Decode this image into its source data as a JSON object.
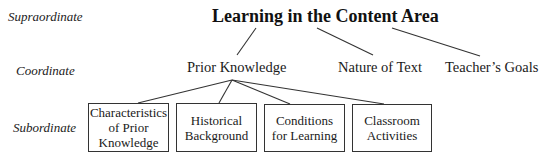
{
  "diagram": {
    "levels": {
      "supraordinate": "Supraordinate",
      "coordinate": "Coordinate",
      "subordinate": "Subordinate"
    },
    "root": {
      "label": "Learning in the Content Area"
    },
    "coordinates": [
      {
        "label": "Prior Knowledge"
      },
      {
        "label": "Nature of Text"
      },
      {
        "label": "Teacher’s Goals"
      }
    ],
    "subordinates": [
      {
        "line1": "Characteristics",
        "line2": "of Prior",
        "line3": "Knowledge"
      },
      {
        "line1": "Historical",
        "line2": "Background"
      },
      {
        "line1": "Conditions",
        "line2": "for Learning"
      },
      {
        "line1": "Classroom",
        "line2": "Activities"
      }
    ],
    "colors": {
      "line": "#333333",
      "text": "#1a1a1a",
      "background": "#ffffff"
    }
  }
}
